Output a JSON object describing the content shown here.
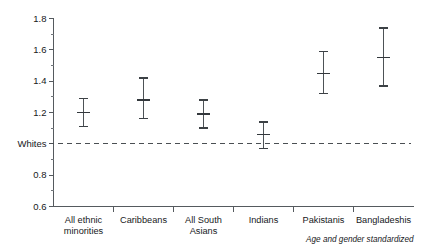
{
  "chart_data": {
    "type": "scatter",
    "title": "",
    "subtitle": "",
    "xlabel": "",
    "ylabel": "",
    "ylim": [
      0.6,
      1.8
    ],
    "grid": false,
    "legend": null,
    "annotations": [
      {
        "name": "footnote",
        "text": "Age and gender standardized",
        "style": "italic",
        "position": "bottom-right"
      },
      {
        "name": "reference-line",
        "text": "Whites",
        "value": 1.0,
        "style": "dashed",
        "position": "y-axis"
      }
    ],
    "categories": [
      "All ethnic minorities",
      "Caribbeans",
      "All South Asians",
      "Indians",
      "Pakistanis",
      "Bangladeshis"
    ],
    "category_lines": [
      [
        "All ethnic",
        "minorities"
      ],
      [
        "Caribbeans",
        ""
      ],
      [
        "All South",
        "Asians"
      ],
      [
        "Indians",
        ""
      ],
      [
        "Pakistanis",
        ""
      ],
      [
        "Bangladeshis",
        ""
      ]
    ],
    "values": [
      1.2,
      1.28,
      1.19,
      1.06,
      1.45,
      1.55
    ],
    "ci_low": [
      1.11,
      1.16,
      1.1,
      0.97,
      1.32,
      1.37
    ],
    "ci_high": [
      1.29,
      1.42,
      1.28,
      1.14,
      1.59,
      1.74
    ],
    "series": [
      {
        "name": "Standardized ratio",
        "values": [
          1.2,
          1.28,
          1.19,
          1.06,
          1.45,
          1.55
        ],
        "ci_low": [
          1.11,
          1.16,
          1.1,
          0.97,
          1.32,
          1.37
        ],
        "ci_high": [
          1.29,
          1.42,
          1.28,
          1.14,
          1.59,
          1.74
        ]
      }
    ],
    "y_ticks_major": [
      0.6,
      0.8,
      1.0,
      1.2,
      1.4,
      1.6,
      1.8
    ],
    "y_tick_labels": [
      "0.6",
      "0.8",
      "Whites",
      "1.2",
      "1.4",
      "1.6",
      "1.8"
    ],
    "y_ticks_minor": [
      0.7,
      0.9,
      1.1,
      1.3,
      1.5,
      1.7
    ],
    "colors": {
      "background": "#ffffff",
      "axis": "#555a5e",
      "marker": "#33383c",
      "reference": "#4a4f53",
      "text": "#17191b"
    }
  }
}
